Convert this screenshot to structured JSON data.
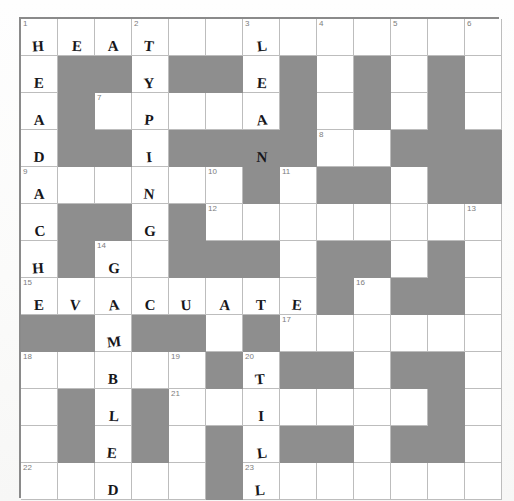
{
  "puzzle": {
    "kind": "crossword-grid",
    "columns": 13,
    "rows": 13,
    "cell_px": 37,
    "colors": {
      "block": "#8e8e8e",
      "cell": "#ffffff",
      "grid_line": "#bdbdbd",
      "border": "#8a8a8a",
      "number": "#7d7d7d",
      "pencil": "#16161a",
      "page": "#fdfdfc"
    },
    "numbers": [
      {
        "n": "1",
        "r": 1,
        "c": 1
      },
      {
        "n": "2",
        "r": 1,
        "c": 4
      },
      {
        "n": "3",
        "r": 1,
        "c": 7
      },
      {
        "n": "4",
        "r": 1,
        "c": 9
      },
      {
        "n": "5",
        "r": 1,
        "c": 11
      },
      {
        "n": "6",
        "r": 1,
        "c": 13
      },
      {
        "n": "7",
        "r": 3,
        "c": 3
      },
      {
        "n": "8",
        "r": 4,
        "c": 9
      },
      {
        "n": "9",
        "r": 5,
        "c": 1
      },
      {
        "n": "10",
        "r": 5,
        "c": 6
      },
      {
        "n": "11",
        "r": 5,
        "c": 8
      },
      {
        "n": "12",
        "r": 6,
        "c": 6
      },
      {
        "n": "13",
        "r": 6,
        "c": 13
      },
      {
        "n": "14",
        "r": 7,
        "c": 3
      },
      {
        "n": "15",
        "r": 8,
        "c": 1
      },
      {
        "n": "16",
        "r": 8,
        "c": 10
      },
      {
        "n": "17",
        "r": 9,
        "c": 8
      },
      {
        "n": "18",
        "r": 10,
        "c": 1
      },
      {
        "n": "19",
        "r": 10,
        "c": 5
      },
      {
        "n": "20",
        "r": 10,
        "c": 7
      },
      {
        "n": "21",
        "r": 11,
        "c": 5
      },
      {
        "n": "22",
        "r": 13,
        "c": 1
      },
      {
        "n": "23",
        "r": 13,
        "c": 7
      }
    ],
    "blocks": [
      {
        "r": 2,
        "c": 2
      },
      {
        "r": 2,
        "c": 3
      },
      {
        "r": 2,
        "c": 5
      },
      {
        "r": 2,
        "c": 6
      },
      {
        "r": 2,
        "c": 8
      },
      {
        "r": 2,
        "c": 10
      },
      {
        "r": 2,
        "c": 12
      },
      {
        "r": 3,
        "c": 2
      },
      {
        "r": 3,
        "c": 8
      },
      {
        "r": 3,
        "c": 10
      },
      {
        "r": 3,
        "c": 12
      },
      {
        "r": 4,
        "c": 2
      },
      {
        "r": 4,
        "c": 3
      },
      {
        "r": 4,
        "c": 5
      },
      {
        "r": 4,
        "c": 6
      },
      {
        "r": 4,
        "c": 7
      },
      {
        "r": 4,
        "c": 8
      },
      {
        "r": 4,
        "c": 11
      },
      {
        "r": 4,
        "c": 12
      },
      {
        "r": 4,
        "c": 13
      },
      {
        "r": 5,
        "c": 7
      },
      {
        "r": 5,
        "c": 9
      },
      {
        "r": 5,
        "c": 10
      },
      {
        "r": 5,
        "c": 12
      },
      {
        "r": 5,
        "c": 13
      },
      {
        "r": 6,
        "c": 2
      },
      {
        "r": 6,
        "c": 3
      },
      {
        "r": 6,
        "c": 5
      },
      {
        "r": 7,
        "c": 2
      },
      {
        "r": 7,
        "c": 5
      },
      {
        "r": 7,
        "c": 6
      },
      {
        "r": 7,
        "c": 7
      },
      {
        "r": 7,
        "c": 9
      },
      {
        "r": 7,
        "c": 10
      },
      {
        "r": 7,
        "c": 12
      },
      {
        "r": 8,
        "c": 9
      },
      {
        "r": 8,
        "c": 11
      },
      {
        "r": 8,
        "c": 12
      },
      {
        "r": 9,
        "c": 1
      },
      {
        "r": 9,
        "c": 2
      },
      {
        "r": 9,
        "c": 4
      },
      {
        "r": 9,
        "c": 5
      },
      {
        "r": 9,
        "c": 7
      },
      {
        "r": 10,
        "c": 6
      },
      {
        "r": 10,
        "c": 8
      },
      {
        "r": 10,
        "c": 9
      },
      {
        "r": 10,
        "c": 11
      },
      {
        "r": 10,
        "c": 12
      },
      {
        "r": 11,
        "c": 2
      },
      {
        "r": 11,
        "c": 4
      },
      {
        "r": 11,
        "c": 12
      },
      {
        "r": 12,
        "c": 2
      },
      {
        "r": 12,
        "c": 4
      },
      {
        "r": 12,
        "c": 6
      },
      {
        "r": 12,
        "c": 8
      },
      {
        "r": 12,
        "c": 9
      },
      {
        "r": 12,
        "c": 11
      },
      {
        "r": 12,
        "c": 12
      },
      {
        "r": 13,
        "c": 6
      }
    ],
    "entries": [
      {
        "r": 1,
        "c": 1,
        "ch": "H"
      },
      {
        "r": 1,
        "c": 2,
        "ch": "E"
      },
      {
        "r": 1,
        "c": 3,
        "ch": "A"
      },
      {
        "r": 1,
        "c": 4,
        "ch": "T"
      },
      {
        "r": 1,
        "c": 7,
        "ch": "L"
      },
      {
        "r": 2,
        "c": 1,
        "ch": "E"
      },
      {
        "r": 2,
        "c": 4,
        "ch": "Y"
      },
      {
        "r": 2,
        "c": 7,
        "ch": "E"
      },
      {
        "r": 3,
        "c": 1,
        "ch": "A"
      },
      {
        "r": 3,
        "c": 4,
        "ch": "P"
      },
      {
        "r": 3,
        "c": 7,
        "ch": "A"
      },
      {
        "r": 4,
        "c": 1,
        "ch": "D"
      },
      {
        "r": 4,
        "c": 4,
        "ch": "I"
      },
      {
        "r": 4,
        "c": 7,
        "ch": "N"
      },
      {
        "r": 5,
        "c": 1,
        "ch": "A"
      },
      {
        "r": 5,
        "c": 4,
        "ch": "N"
      },
      {
        "r": 6,
        "c": 1,
        "ch": "C"
      },
      {
        "r": 6,
        "c": 4,
        "ch": "G"
      },
      {
        "r": 7,
        "c": 1,
        "ch": "H"
      },
      {
        "r": 7,
        "c": 3,
        "ch": "G"
      },
      {
        "r": 8,
        "c": 1,
        "ch": "E"
      },
      {
        "r": 8,
        "c": 2,
        "ch": "V"
      },
      {
        "r": 8,
        "c": 3,
        "ch": "A"
      },
      {
        "r": 8,
        "c": 4,
        "ch": "C"
      },
      {
        "r": 8,
        "c": 5,
        "ch": "U"
      },
      {
        "r": 8,
        "c": 6,
        "ch": "A"
      },
      {
        "r": 8,
        "c": 7,
        "ch": "T"
      },
      {
        "r": 8,
        "c": 8,
        "ch": "E"
      },
      {
        "r": 9,
        "c": 3,
        "ch": "M"
      },
      {
        "r": 10,
        "c": 3,
        "ch": "B"
      },
      {
        "r": 10,
        "c": 7,
        "ch": "T"
      },
      {
        "r": 11,
        "c": 3,
        "ch": "L"
      },
      {
        "r": 11,
        "c": 7,
        "ch": "I"
      },
      {
        "r": 12,
        "c": 3,
        "ch": "E"
      },
      {
        "r": 12,
        "c": 7,
        "ch": "L"
      },
      {
        "r": 13,
        "c": 3,
        "ch": "D"
      },
      {
        "r": 13,
        "c": 7,
        "ch": "L"
      }
    ],
    "filled_words": {
      "1_down": "HEADACHE",
      "1_across": "HEAT",
      "2_down": "TYPING",
      "3_down": "LEAN",
      "14_down": "GAMBLED",
      "15_across": "EVACUATE",
      "20_down": "TILL"
    }
  }
}
